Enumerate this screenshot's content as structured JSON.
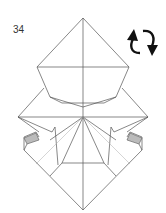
{
  "step": {
    "number": "34"
  },
  "icons": {
    "rotate": "rotate-arrows-icon"
  },
  "colors": {
    "line": "#555555",
    "fold": "#999999",
    "shade": "#bbbbbb",
    "arrow": "#111111"
  }
}
